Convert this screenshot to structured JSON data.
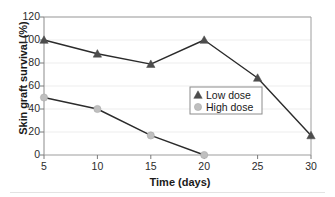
{
  "chart_data": {
    "type": "line",
    "title": "",
    "xlabel": "Time (days)",
    "ylabel": "Skin graft survival (%)",
    "x": [
      5,
      10,
      15,
      20,
      25,
      30
    ],
    "xlim": [
      5,
      30
    ],
    "ylim": [
      0,
      120
    ],
    "xticks": [
      "5",
      "10",
      "15",
      "20",
      "25",
      "30"
    ],
    "yticks": [
      "0",
      "20",
      "40",
      "60",
      "80",
      "100",
      "120"
    ],
    "grid": "horizontal",
    "legend_position": "center-right",
    "series": [
      {
        "name": "Low dose",
        "marker": "triangle",
        "color": "#4d4d4d",
        "line_color": "#2b2b2b",
        "x": [
          5,
          10,
          15,
          20,
          25,
          30
        ],
        "values": [
          100,
          88,
          79,
          100,
          67,
          17
        ]
      },
      {
        "name": "High dose",
        "marker": "circle",
        "color": "#bfbfbf",
        "line_color": "#2b2b2b",
        "x": [
          5,
          10,
          15,
          20
        ],
        "values": [
          50,
          40,
          17,
          0
        ]
      }
    ]
  },
  "legend": {
    "entries": [
      {
        "label": "Low dose"
      },
      {
        "label": "High dose"
      }
    ]
  },
  "axes": {
    "frame_color": "#9e9e9e",
    "grid_color": "#ededed",
    "tick_color": "#7a7a7a"
  }
}
